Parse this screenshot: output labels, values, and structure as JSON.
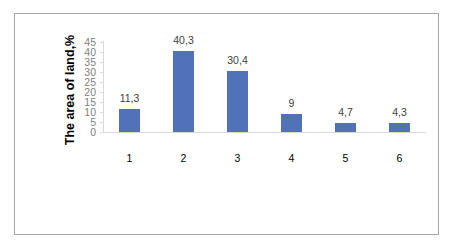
{
  "chart_data": {
    "type": "bar",
    "title": "",
    "xlabel": "",
    "ylabel": "The area of land,%",
    "categories": [
      "1",
      "2",
      "3",
      "4",
      "5",
      "6"
    ],
    "values": [
      11.3,
      40.3,
      30.4,
      9,
      4.7,
      4.3
    ],
    "data_labels": [
      "11,3",
      "40,3",
      "30,4",
      "9",
      "4,7",
      "4,3"
    ],
    "ylim": [
      0,
      45
    ],
    "yticks": [
      "0",
      "5",
      "10",
      "15",
      "20",
      "25",
      "30",
      "35",
      "40",
      "45"
    ],
    "grid": false,
    "legend": null,
    "bar_color": "#4f72b8"
  }
}
